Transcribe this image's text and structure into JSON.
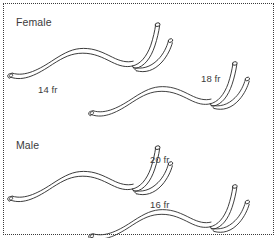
{
  "figure": {
    "background_color": "#ffffff",
    "border_color": "#3a3a3a",
    "border_style": "dotted",
    "line_color": "#2b2b2b",
    "text_color": "#3b3b3b"
  },
  "groups": [
    {
      "id": "female",
      "label": "Female"
    },
    {
      "id": "male",
      "label": "Male"
    }
  ],
  "catheters": [
    {
      "id": "catheter-14fr",
      "group": "female",
      "size_label": "14 fr",
      "french_size": 14,
      "row": "top",
      "column": "left"
    },
    {
      "id": "catheter-18fr",
      "group": "female",
      "size_label": "18 fr",
      "french_size": 18,
      "row": "top",
      "column": "right"
    },
    {
      "id": "catheter-20fr",
      "group": "male",
      "size_label": "20 fr",
      "french_size": 20,
      "row": "bottom",
      "column": "left"
    },
    {
      "id": "catheter-16fr",
      "group": "male",
      "size_label": "16 fr",
      "french_size": 16,
      "row": "bottom",
      "column": "right"
    }
  ],
  "legend": {
    "unit": "fr",
    "unit_name": "French"
  }
}
